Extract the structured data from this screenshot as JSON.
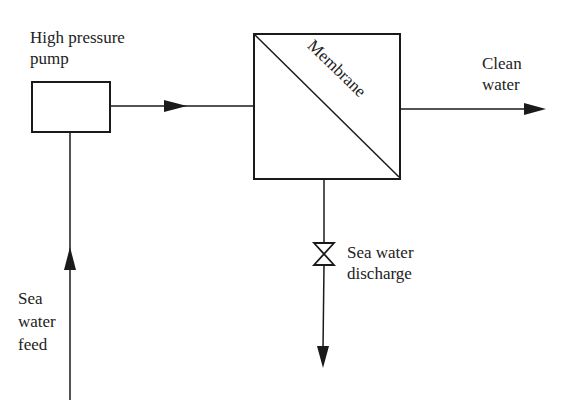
{
  "diagram": {
    "nodes": [
      {
        "id": "pump",
        "label_line1": "High pressure",
        "label_line2": "pump"
      },
      {
        "id": "membrane",
        "label": "Membrane"
      },
      {
        "id": "valve",
        "label": "valve"
      }
    ],
    "streams": {
      "feed": {
        "line1": "Sea",
        "line2": "water",
        "line3": "feed"
      },
      "clean": {
        "line1": "Clean",
        "line2": "water"
      },
      "discharge": {
        "line1": "Sea water",
        "line2": "discharge"
      }
    },
    "edges": [
      {
        "from": "sea-water-feed",
        "to": "pump"
      },
      {
        "from": "pump",
        "to": "membrane"
      },
      {
        "from": "membrane",
        "to": "clean-water"
      },
      {
        "from": "membrane",
        "to": "valve"
      },
      {
        "from": "valve",
        "to": "sea-water-discharge"
      }
    ],
    "colors": {
      "line": "#1a1a1a",
      "text": "#222222",
      "background": "#ffffff"
    }
  }
}
